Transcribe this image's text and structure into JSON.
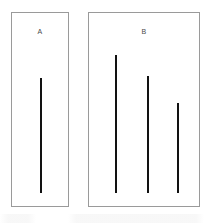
{
  "figure": {
    "type": "line-judgment-stimulus",
    "background_color": "#ffffff",
    "card_border_color": "#9a9a9a",
    "line_color": "#121212",
    "label_color": "#4a4a4a"
  },
  "cards": [
    {
      "id": "a",
      "label": "A",
      "role": "standard",
      "lines": [
        {
          "name": "standard-line",
          "length_px": 115,
          "relative_length": 1.0
        }
      ]
    },
    {
      "id": "b",
      "label": "B",
      "role": "comparison",
      "lines": [
        {
          "name": "comparison-line-1",
          "length_px": 138,
          "relative_length": 1.2
        },
        {
          "name": "comparison-line-2",
          "length_px": 117,
          "relative_length": 1.02
        },
        {
          "name": "comparison-line-3",
          "length_px": 90,
          "relative_length": 0.78
        }
      ]
    }
  ]
}
